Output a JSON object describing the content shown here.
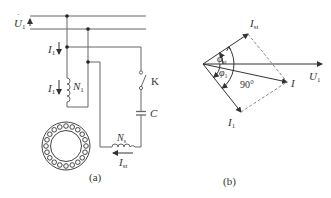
{
  "figure_a": {
    "caption": "(a)",
    "labels": {
      "supply_voltage": "U",
      "supply_voltage_sub": "1",
      "line_current": "I",
      "line_current_sub": "1",
      "main_coil_current": "I",
      "main_coil_current_sub": "1",
      "main_winding": "N",
      "main_winding_sub": "1",
      "switch": "K",
      "capacitor": "C",
      "start_winding": "N",
      "start_winding_sub": "s",
      "start_current": "I",
      "start_current_sub": "st"
    }
  },
  "figure_b": {
    "caption": "(b)",
    "labels": {
      "voltage": "U",
      "voltage_sub": "1",
      "start_current": "I",
      "start_current_sub": "st",
      "total_current": "I",
      "main_current": "I",
      "main_current_sub": "1",
      "phi_st": "φ",
      "phi_st_sub": "st",
      "phi_1": "φ",
      "phi_1_sub": "1",
      "angle": "90°"
    }
  },
  "colors": {
    "line": "#555555",
    "text": "#333333",
    "dashed": "#888888"
  }
}
